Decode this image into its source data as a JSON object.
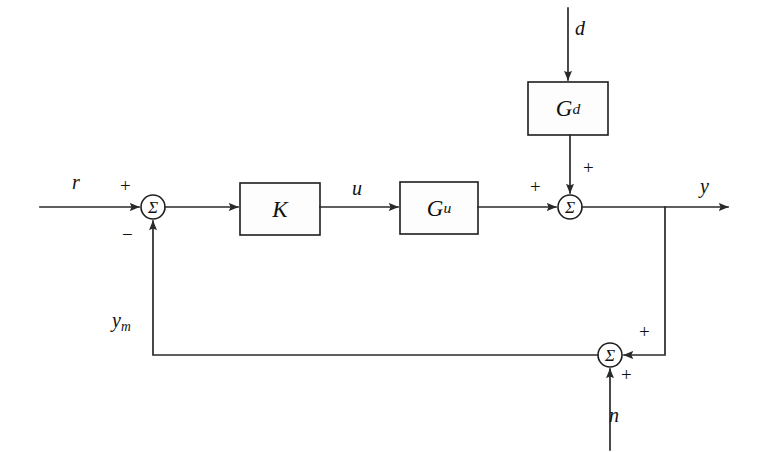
{
  "diagram": {
    "colors": {
      "background": "#ffffff",
      "line": "#2a2a2a",
      "block_stroke": "#1d1d1d",
      "block_fill": "#fdfdfd",
      "text": "#111111"
    },
    "blocks": [
      {
        "id": "Gd",
        "base": "G",
        "sub": "d",
        "x": 528,
        "y": 82,
        "w": 80,
        "h": 53
      },
      {
        "id": "K",
        "base": "K",
        "sub": "",
        "x": 240,
        "y": 183,
        "w": 80,
        "h": 52
      },
      {
        "id": "Gu",
        "base": "G",
        "sub": "u",
        "x": 400,
        "y": 182,
        "w": 78,
        "h": 52
      }
    ],
    "summing_junctions": [
      {
        "id": "sum-error",
        "glyph": "Σ",
        "cx": 153,
        "cy": 207,
        "r": 12
      },
      {
        "id": "sum-output",
        "glyph": "Σ",
        "cx": 570,
        "cy": 207,
        "r": 12
      },
      {
        "id": "sum-measure",
        "glyph": "Σ",
        "cx": 610,
        "cy": 355,
        "r": 12
      }
    ],
    "signals": [
      {
        "id": "r",
        "base": "r",
        "sub": "",
        "x": 72,
        "y": 172
      },
      {
        "id": "u",
        "base": "u",
        "sub": "",
        "x": 352,
        "y": 178
      },
      {
        "id": "y",
        "base": "y",
        "sub": "",
        "x": 700,
        "y": 176
      },
      {
        "id": "d",
        "base": "d",
        "sub": "",
        "x": 575,
        "y": 18
      },
      {
        "id": "n",
        "base": "n",
        "sub": "",
        "x": 609,
        "y": 405
      },
      {
        "id": "ym",
        "base": "y",
        "sub": "m",
        "x": 112,
        "y": 310
      }
    ],
    "signs": [
      {
        "id": "sign-r-plus",
        "symbol": "+",
        "x": 120,
        "y": 176
      },
      {
        "id": "sign-ym-minus",
        "symbol": "−",
        "x": 122,
        "y": 225
      },
      {
        "id": "sign-gu-plus",
        "symbol": "+",
        "x": 530,
        "y": 177
      },
      {
        "id": "sign-gd-plus",
        "symbol": "+",
        "x": 583,
        "y": 158
      },
      {
        "id": "sign-y-fb-plus",
        "symbol": "+",
        "x": 639,
        "y": 322
      },
      {
        "id": "sign-n-plus",
        "symbol": "+",
        "x": 621,
        "y": 365
      }
    ],
    "wires": [
      {
        "id": "wire-r-to-sum",
        "from": "r input",
        "to": "sum-error"
      },
      {
        "id": "wire-sum-to-K",
        "from": "sum-error",
        "to": "K"
      },
      {
        "id": "wire-K-to-Gu",
        "from": "K",
        "to": "Gu"
      },
      {
        "id": "wire-Gu-to-sum",
        "from": "Gu",
        "to": "sum-output"
      },
      {
        "id": "wire-d-to-Gd",
        "from": "d input",
        "to": "Gd"
      },
      {
        "id": "wire-Gd-to-sum",
        "from": "Gd",
        "to": "sum-output"
      },
      {
        "id": "wire-sum-to-y",
        "from": "sum-output",
        "to": "y output"
      },
      {
        "id": "wire-y-branch-down",
        "from": "y branch",
        "to": "sum-measure"
      },
      {
        "id": "wire-n-to-sum",
        "from": "n input",
        "to": "sum-measure"
      },
      {
        "id": "wire-feedback",
        "from": "sum-measure",
        "to": "sum-error"
      }
    ]
  }
}
